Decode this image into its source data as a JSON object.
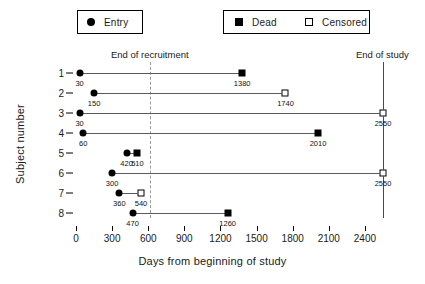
{
  "legend": {
    "entry": {
      "label": "Entry",
      "marker": "filled-circle-icon"
    },
    "dead": {
      "label": "Dead",
      "marker": "filled-square-icon"
    },
    "censored": {
      "label": "Censored",
      "marker": "open-square-icon"
    }
  },
  "annotations": {
    "end_of_recruitment": "End of recruitment",
    "end_of_study": "End of study"
  },
  "chart_data": {
    "type": "scatter",
    "title": "",
    "subtitle": "",
    "xlabel": "Days from beginning of study",
    "ylabel": "Subject number",
    "xlim": [
      0,
      2700
    ],
    "ylim": [
      0.5,
      8.5
    ],
    "grid": false,
    "legend_position": "top",
    "xticks": [
      0,
      300,
      600,
      900,
      1200,
      1500,
      1800,
      2100,
      2400
    ],
    "xticklabels": [
      "0",
      "300",
      "600",
      "900",
      "1200",
      "1500",
      "1800",
      "2100",
      "2400"
    ],
    "yticks": [
      1,
      2,
      3,
      4,
      5,
      6,
      7,
      8
    ],
    "yticklabels": [
      "1",
      "2",
      "3",
      "4",
      "5",
      "6",
      "7",
      "8"
    ],
    "vlines": [
      {
        "x": 600,
        "label": "End of recruitment",
        "style": "dashed",
        "color": "#9a9a9a"
      },
      {
        "x": 2550,
        "label": "End of study",
        "style": "solid",
        "color": "#4a4a4a"
      }
    ],
    "series": [
      {
        "name": "Entry",
        "marker": "filled-circle",
        "values": [
          30,
          150,
          30,
          60,
          420,
          300,
          360,
          470
        ]
      },
      {
        "name": "Outcome",
        "marker": "varies",
        "values": [
          1380,
          1740,
          2550,
          2010,
          510,
          2550,
          540,
          1260
        ]
      }
    ],
    "subjects": [
      {
        "subject": "1",
        "entry": 30,
        "entry_label": "30",
        "end": 1380,
        "end_label": "1380",
        "outcome": "Dead"
      },
      {
        "subject": "2",
        "entry": 150,
        "entry_label": "150",
        "end": 1740,
        "end_label": "1740",
        "outcome": "Censored"
      },
      {
        "subject": "3",
        "entry": 30,
        "entry_label": "30",
        "end": 2550,
        "end_label": "2550",
        "outcome": "Censored"
      },
      {
        "subject": "4",
        "entry": 60,
        "entry_label": "60",
        "end": 2010,
        "end_label": "2010",
        "outcome": "Dead"
      },
      {
        "subject": "5",
        "entry": 420,
        "entry_label": "420",
        "end": 510,
        "end_label": "510",
        "outcome": "Dead"
      },
      {
        "subject": "6",
        "entry": 300,
        "entry_label": "300",
        "end": 2550,
        "end_label": "2550",
        "outcome": "Censored"
      },
      {
        "subject": "7",
        "entry": 360,
        "entry_label": "360",
        "end": 540,
        "end_label": "540",
        "outcome": "Censored"
      },
      {
        "subject": "8",
        "entry": 470,
        "entry_label": "470",
        "end": 1260,
        "end_label": "1260",
        "outcome": "Dead"
      }
    ]
  }
}
